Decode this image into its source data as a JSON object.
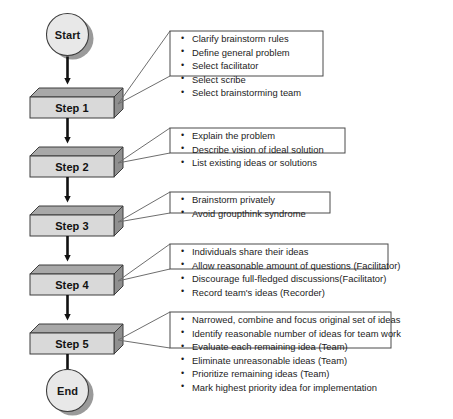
{
  "diagram": {
    "type": "flowchart",
    "orientation": "top-to-bottom",
    "colors": {
      "box_face": "#d9d9d9",
      "box_top_bevel": "#a8a8a8",
      "box_side_bevel": "#8f8f8f",
      "terminator_fill": "#e3e3e3",
      "terminator_shadow": "#9a9a9a",
      "outline": "#3d3d3d",
      "arrow": "#111111",
      "note_border": "#4a4a4a",
      "connector": "#6e6e6e",
      "text": "#171717",
      "background": "#ffffff"
    },
    "start_node": {
      "label": "Start",
      "shape": "circle"
    },
    "end_node": {
      "label": "End",
      "shape": "circle"
    },
    "steps": [
      {
        "label": "Step 1",
        "notes": [
          "Clarify brainstorm rules",
          "Define general problem",
          "Select facilitator",
          "Select scribe",
          "Select brainstorming team"
        ]
      },
      {
        "label": "Step 2",
        "notes": [
          "Explain the problem",
          "Describe vision of ideal solution",
          "List existing ideas or solutions"
        ]
      },
      {
        "label": "Step 3",
        "notes": [
          "Brainstorm privately",
          "Avoid groupthink syndrome"
        ]
      },
      {
        "label": "Step 4",
        "notes": [
          "Individuals share their ideas",
          "Allow reasonable amount of questions (Facilitator)",
          "Discourage full-fledged discussions(Facilitator)",
          "Record team's ideas (Recorder)"
        ]
      },
      {
        "label": "Step 5",
        "notes": [
          "Narrowed, combine and focus original set of ideas",
          "Identify reasonable number of ideas for team work",
          "Evaluate each remaining idea (Team)",
          "Eliminate unreasonable ideas (Team)",
          "Prioritize remaining ideas (Team)",
          "Mark highest priority idea for implementation"
        ]
      }
    ]
  }
}
